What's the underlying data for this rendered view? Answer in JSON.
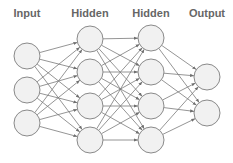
{
  "diagram": {
    "type": "feedforward-neural-network",
    "layers": [
      {
        "label": "Input",
        "x": 27,
        "nodes": [
          56,
          90,
          123
        ]
      },
      {
        "label": "Hidden",
        "x": 90,
        "nodes": [
          39,
          72,
          106,
          140
        ]
      },
      {
        "label": "Hidden",
        "x": 151,
        "nodes": [
          38,
          72,
          106,
          140
        ]
      },
      {
        "label": "Output",
        "x": 207,
        "nodes": [
          77,
          113
        ]
      }
    ],
    "node_radius": 13,
    "label_y": 17,
    "colors": {
      "node_fill": "#f1f1f1",
      "node_stroke": "#8a8a8a",
      "edge": "#7a7a7a",
      "label": "#666666"
    },
    "connections": "fully-connected-between-adjacent-layers"
  }
}
